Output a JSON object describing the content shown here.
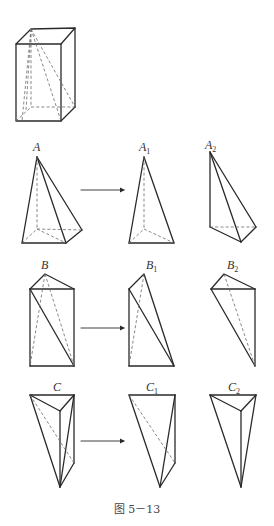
{
  "figure": {
    "caption": "图 5－13",
    "labels": {
      "A": {
        "base": "A",
        "sub": ""
      },
      "A1": {
        "base": "A",
        "sub": "1"
      },
      "A2": {
        "base": "A",
        "sub": "2"
      },
      "B": {
        "base": "B",
        "sub": ""
      },
      "B1": {
        "base": "B",
        "sub": "1"
      },
      "B2": {
        "base": "B",
        "sub": "2"
      },
      "C": {
        "base": "C",
        "sub": ""
      },
      "C1": {
        "base": "C",
        "sub": "1"
      },
      "C2": {
        "base": "C",
        "sub": "2"
      }
    },
    "rows": [
      {
        "name": "A",
        "parts": [
          "A",
          "A1",
          "A2"
        ],
        "description": "quadrangular pyramid split into two triangular pyramids"
      },
      {
        "name": "B",
        "parts": [
          "B",
          "B1",
          "B2"
        ]
      },
      {
        "name": "C",
        "parts": [
          "C",
          "C1",
          "C2"
        ]
      }
    ],
    "colors": {
      "line": "#2a2a2a",
      "dashed": "#6a6a6a",
      "background": "#ffffff"
    }
  }
}
